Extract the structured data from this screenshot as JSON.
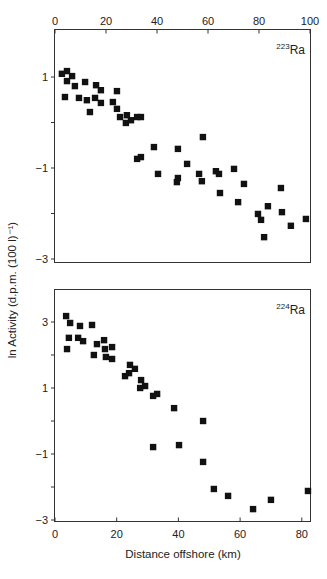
{
  "chart_data": [
    {
      "type": "scatter",
      "panel": "top",
      "title": "",
      "annotation": {
        "mass": "223",
        "element": "Ra"
      },
      "xlabel": "",
      "ylabel": "ln Activity (d.p.m. (100 l)⁻¹)",
      "x_axis_position": "top",
      "xlim": [
        0,
        100
      ],
      "ylim": [
        -3,
        2.2
      ],
      "x_ticks": [
        0,
        20,
        40,
        60,
        80,
        100
      ],
      "x_tick_labels": [
        "0",
        "20",
        "40",
        "60",
        "80",
        "100"
      ],
      "y_ticks": [
        1,
        0,
        -1,
        -2,
        -3
      ],
      "y_tick_labels": [
        "1",
        "",
        "−1",
        "",
        "−3"
      ],
      "grid": false,
      "legend": null,
      "series": [
        {
          "name": "223Ra",
          "marker": "square",
          "points": [
            [
              4.7,
              1.13
            ],
            [
              2.7,
              1.07
            ],
            [
              6.7,
              1.02
            ],
            [
              4.7,
              0.91
            ],
            [
              7.8,
              0.8
            ],
            [
              11.8,
              0.89
            ],
            [
              16.1,
              0.82
            ],
            [
              18.0,
              0.71
            ],
            [
              24.3,
              0.69
            ],
            [
              3.9,
              0.56
            ],
            [
              9.4,
              0.54
            ],
            [
              12.5,
              0.49
            ],
            [
              15.7,
              0.54
            ],
            [
              18.0,
              0.43
            ],
            [
              22.7,
              0.45
            ],
            [
              24.3,
              0.3
            ],
            [
              13.7,
              0.23
            ],
            [
              25.5,
              0.12
            ],
            [
              28.2,
              0.16
            ],
            [
              29.8,
              0.05
            ],
            [
              27.8,
              -0.01
            ],
            [
              32.2,
              0.12
            ],
            [
              33.7,
              0.12
            ],
            [
              38.8,
              -0.54
            ],
            [
              32.2,
              -0.8
            ],
            [
              33.7,
              -0.76
            ],
            [
              58.0,
              -0.32
            ],
            [
              48.2,
              -0.58
            ],
            [
              51.8,
              -0.91
            ],
            [
              40.4,
              -1.13
            ],
            [
              48.2,
              -1.22
            ],
            [
              47.8,
              -1.31
            ],
            [
              56.5,
              -1.13
            ],
            [
              57.6,
              -1.29
            ],
            [
              63.1,
              -1.07
            ],
            [
              64.3,
              -1.13
            ],
            [
              70.2,
              -1.02
            ],
            [
              64.7,
              -1.55
            ],
            [
              71.8,
              -1.75
            ],
            [
              74.1,
              -1.35
            ],
            [
              88.6,
              -1.44
            ],
            [
              83.5,
              -1.84
            ],
            [
              89.0,
              -1.97
            ],
            [
              79.6,
              -2.01
            ],
            [
              80.8,
              -2.14
            ],
            [
              92.5,
              -2.27
            ],
            [
              98.4,
              -2.12
            ],
            [
              82.0,
              -2.52
            ]
          ]
        }
      ]
    },
    {
      "type": "scatter",
      "panel": "bottom",
      "title": "",
      "annotation": {
        "mass": "224",
        "element": "Ra"
      },
      "xlabel": "Distance offshore (km)",
      "ylabel": "ln Activity (d.p.m. (100 l)⁻¹)",
      "x_axis_position": "bottom",
      "xlim": [
        0,
        83
      ],
      "ylim": [
        -3.1,
        4.0
      ],
      "x_ticks": [
        0,
        20,
        40,
        60,
        80
      ],
      "x_tick_labels": [
        "0",
        "20",
        "40",
        "60",
        "80"
      ],
      "y_ticks": [
        3,
        2,
        1,
        0,
        -1,
        -2,
        -3
      ],
      "y_tick_labels": [
        "3",
        "",
        "1",
        "",
        "−1",
        "",
        "−3"
      ],
      "grid": false,
      "legend": null,
      "series": [
        {
          "name": "224Ra",
          "marker": "square",
          "points": [
            [
              3.6,
              3.18
            ],
            [
              4.9,
              2.97
            ],
            [
              8.1,
              2.88
            ],
            [
              12.0,
              2.91
            ],
            [
              4.5,
              2.52
            ],
            [
              7.5,
              2.52
            ],
            [
              9.1,
              2.42
            ],
            [
              13.6,
              2.33
            ],
            [
              15.9,
              2.45
            ],
            [
              3.9,
              2.18
            ],
            [
              12.6,
              2.0
            ],
            [
              16.2,
              2.18
            ],
            [
              18.5,
              2.24
            ],
            [
              16.5,
              1.94
            ],
            [
              18.5,
              1.88
            ],
            [
              24.3,
              1.7
            ],
            [
              25.9,
              1.58
            ],
            [
              24.0,
              1.45
            ],
            [
              22.7,
              1.36
            ],
            [
              27.9,
              1.24
            ],
            [
              29.2,
              1.06
            ],
            [
              27.6,
              1.0
            ],
            [
              31.8,
              0.76
            ],
            [
              33.1,
              0.82
            ],
            [
              38.6,
              0.39
            ],
            [
              48.0,
              0.0
            ],
            [
              31.8,
              -0.79
            ],
            [
              40.2,
              -0.73
            ],
            [
              48.0,
              -1.24
            ],
            [
              51.5,
              -2.06
            ],
            [
              56.1,
              -2.27
            ],
            [
              64.2,
              -2.67
            ],
            [
              70.0,
              -2.39
            ],
            [
              82.0,
              -2.12
            ]
          ]
        }
      ]
    }
  ],
  "labels": {
    "y_axis": "ln Activity (d.p.m. (100 l)⁻¹)",
    "x_axis": "Distance offshore (km)",
    "top_iso_mass": "223",
    "top_iso_el": "Ra",
    "bottom_iso_mass": "224",
    "bottom_iso_el": "Ra"
  }
}
